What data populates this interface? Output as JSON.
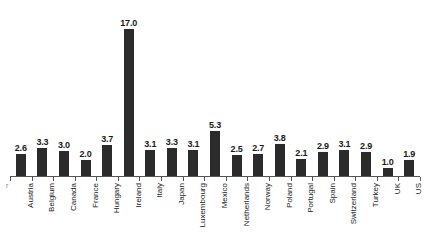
{
  "chart_data": {
    "type": "bar",
    "title": "",
    "subtitle": "",
    "xlabel": "",
    "ylabel": "",
    "ylim": [
      0,
      18
    ],
    "grid": false,
    "legend": null,
    "bar_color": "#2b2b2b",
    "axis_color": "#555555",
    "background": "#ffffff",
    "data_labels_shown": true,
    "label_rotation_degrees": 90,
    "categories": [
      "Austria",
      "Belgium",
      "Canada",
      "France",
      "Hungary",
      "Ireland",
      "Italy",
      "Japan",
      "Luxembourg",
      "Mexico",
      "Netherlands",
      "Norway",
      "Poland",
      "Portugal",
      "Spain",
      "Switzerland",
      "Turkey",
      "UK",
      "US"
    ],
    "values": [
      2.6,
      3.3,
      3.0,
      2.0,
      3.7,
      17.0,
      3.1,
      3.3,
      3.1,
      5.3,
      2.5,
      2.7,
      3.8,
      2.1,
      2.9,
      3.1,
      2.9,
      1.0,
      1.9
    ],
    "value_labels": [
      "2.6",
      "3.3",
      "3.0",
      "2.0",
      "3.7",
      "17.0",
      "3.1",
      "3.3",
      "3.1",
      "5.3",
      "2.5",
      "2.7",
      "3.8",
      "2.1",
      "2.9",
      "3.1",
      "2.9",
      "1.0",
      "1.9"
    ]
  },
  "axis": {
    "origin_mark": "r"
  }
}
